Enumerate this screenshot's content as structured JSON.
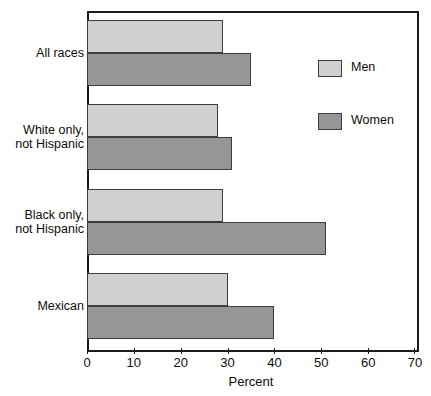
{
  "chart_data": {
    "type": "bar",
    "orientation": "horizontal",
    "title": "",
    "xlabel": "Percent",
    "ylabel": "",
    "xlim": [
      0,
      70
    ],
    "xticks": [
      0,
      10,
      20,
      30,
      40,
      50,
      60,
      70
    ],
    "xtick_labels": [
      "0",
      "10",
      "20",
      "30",
      "40",
      "50",
      "60",
      "70"
    ],
    "grid": false,
    "legend_position": "right-top",
    "categories": [
      "All races",
      "White only,\nnot Hispanic",
      "Black only,\nnot Hispanic",
      "Mexican"
    ],
    "series": [
      {
        "name": "Men",
        "color": "#d0d0d0",
        "values": [
          29,
          28,
          29,
          30
        ]
      },
      {
        "name": "Women",
        "color": "#969696",
        "values": [
          35,
          31,
          51,
          40
        ]
      }
    ]
  },
  "legend": {
    "items": [
      {
        "label": "Men",
        "swatch": "men"
      },
      {
        "label": "Women",
        "swatch": "women"
      }
    ]
  },
  "axis": {
    "x_title": "Percent"
  }
}
